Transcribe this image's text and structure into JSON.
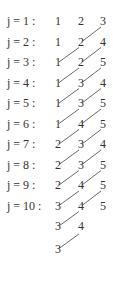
{
  "rows": [
    {
      "label": "j = 1 :",
      "values": [
        "1",
        "2",
        "3"
      ]
    },
    {
      "label": "j = 2 :",
      "values": [
        "1",
        "2",
        "4"
      ]
    },
    {
      "label": "j = 3 :",
      "values": [
        "1",
        "2",
        "5"
      ]
    },
    {
      "label": "j = 4 :",
      "values": [
        "1",
        "3",
        "4"
      ]
    },
    {
      "label": "j = 5 :",
      "values": [
        "1",
        "3",
        "5"
      ]
    },
    {
      "label": "j = 6 :",
      "values": [
        "1",
        "4",
        "5"
      ]
    },
    {
      "label": "j = 7 :",
      "values": [
        "2",
        "3",
        "4"
      ]
    },
    {
      "label": "j = 8 :",
      "values": [
        "2",
        "3",
        "5"
      ]
    },
    {
      "label": "j = 9 :",
      "values": [
        "2",
        "4",
        "5"
      ]
    },
    {
      "label": "j = 10 :",
      "values": [
        "3",
        "4",
        "5"
      ]
    }
  ],
  "extra_rows": [
    {
      "values": [
        "3",
        "4"
      ]
    },
    {
      "values": [
        "3"
      ]
    }
  ],
  "links": [
    {
      "from_row": 1,
      "col": 1
    },
    {
      "from_row": 2,
      "col": 0
    },
    {
      "from_row": 2,
      "col": 1
    },
    {
      "from_row": 3,
      "col": 0
    },
    {
      "from_row": 3,
      "col": 1
    },
    {
      "from_row": 4,
      "col": 0
    },
    {
      "from_row": 4,
      "col": 1
    },
    {
      "from_row": 5,
      "col": 0
    },
    {
      "from_row": 5,
      "col": 1
    },
    {
      "from_row": 6,
      "col": 0
    },
    {
      "from_row": 6,
      "col": 1
    },
    {
      "from_row": 7,
      "col": 0
    },
    {
      "from_row": 7,
      "col": 1
    },
    {
      "from_row": 8,
      "col": 0
    },
    {
      "from_row": 8,
      "col": 1
    },
    {
      "from_row": 9,
      "col": 0
    },
    {
      "from_row": 9,
      "col": 1
    },
    {
      "from_row": 10,
      "col": 0
    }
  ]
}
